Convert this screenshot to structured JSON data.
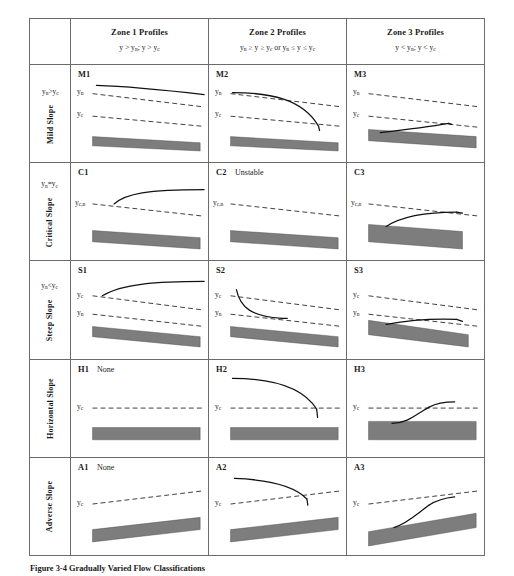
{
  "figure": {
    "caption": "Figure 3-4  Gradually Varied Flow Classifications"
  },
  "table": {
    "corner_label": "",
    "columns": [
      {
        "title": "Zone 1 Profiles",
        "condition": "y > yₙ; y > y_c"
      },
      {
        "title": "Zone 2 Profiles",
        "condition": "yₙ ≥ y ≥ y_c  or  yₙ ≤ y ≤ y_c"
      },
      {
        "title": "Zone 3 Profiles",
        "condition": "y < yₙ; y < y_c"
      }
    ],
    "rows": [
      {
        "name": "Mild Slope",
        "condition": "yₙ > y_c",
        "cells": [
          {
            "tag": "M1",
            "note": "",
            "labels": [
              "yₙ",
              "y_c"
            ]
          },
          {
            "tag": "M2",
            "note": "",
            "labels": [
              "yₙ",
              "y_c"
            ]
          },
          {
            "tag": "M3",
            "note": "",
            "labels": [
              "yₙ",
              "y_c"
            ]
          }
        ]
      },
      {
        "name": "Critical Slope",
        "condition": "yₙ = y_c",
        "cells": [
          {
            "tag": "C1",
            "note": "",
            "labels": [
              "y_c,n"
            ]
          },
          {
            "tag": "C2",
            "note": "Unstable",
            "labels": [
              "y_c,n"
            ]
          },
          {
            "tag": "C3",
            "note": "",
            "labels": [
              "y_c,n"
            ]
          }
        ]
      },
      {
        "name": "Steep Slope",
        "condition": "yₙ < y_c",
        "cells": [
          {
            "tag": "S1",
            "note": "",
            "labels": [
              "y_c",
              "yₙ"
            ]
          },
          {
            "tag": "S2",
            "note": "",
            "labels": [
              "y_c",
              "yₙ"
            ]
          },
          {
            "tag": "S3",
            "note": "",
            "labels": [
              "y_c",
              "yₙ"
            ]
          }
        ]
      },
      {
        "name": "Horizontal Slope",
        "condition": "",
        "cells": [
          {
            "tag": "H1",
            "note": "None",
            "labels": [
              "y_c"
            ]
          },
          {
            "tag": "H2",
            "note": "",
            "labels": [
              "y_c"
            ]
          },
          {
            "tag": "H3",
            "note": "",
            "labels": [
              "y_c"
            ]
          }
        ]
      },
      {
        "name": "Adverse Slope",
        "condition": "",
        "cells": [
          {
            "tag": "A1",
            "note": "None",
            "labels": [
              "y_c"
            ]
          },
          {
            "tag": "A2",
            "note": "",
            "labels": [
              "y_c"
            ]
          },
          {
            "tag": "A3",
            "note": "",
            "labels": [
              "y_c"
            ]
          }
        ]
      }
    ]
  },
  "style": {
    "bed_color": "#7d7d7d",
    "line_color": "#111111",
    "border_color": "#6b6b6b"
  }
}
